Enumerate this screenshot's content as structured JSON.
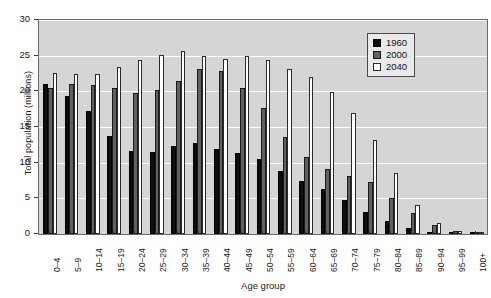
{
  "chart_data": {
    "type": "bar",
    "title": "",
    "xlabel": "Age group",
    "ylabel": "Total population (millions)",
    "ylim": [
      0,
      30
    ],
    "yticks": [
      0,
      5,
      10,
      15,
      20,
      25,
      30
    ],
    "grid": true,
    "legend_position": "top-right",
    "categories": [
      "0–4",
      "5–9",
      "10–14",
      "15–19",
      "20–24",
      "25–29",
      "30–34",
      "35–39",
      "40–44",
      "45–49",
      "50–54",
      "55–59",
      "60–64",
      "65–69",
      "70–74",
      "75–79",
      "80–84",
      "85–89",
      "90–94",
      "95–99",
      "100+"
    ],
    "series": [
      {
        "name": "1960",
        "color": "#0d0d0d",
        "values": [
          21.0,
          19.4,
          17.3,
          13.8,
          11.6,
          11.5,
          12.4,
          12.7,
          11.9,
          11.4,
          10.5,
          8.8,
          7.5,
          6.3,
          4.7,
          3.1,
          1.8,
          0.9,
          0.35,
          0.08,
          0.02
        ]
      },
      {
        "name": "2000",
        "color": "#616161",
        "values": [
          20.4,
          21.1,
          20.9,
          20.5,
          19.8,
          20.2,
          21.4,
          23.2,
          22.9,
          20.5,
          17.6,
          13.6,
          10.8,
          9.1,
          8.2,
          7.3,
          5.0,
          2.9,
          1.3,
          0.37,
          0.07
        ]
      },
      {
        "name": "2040",
        "color": "#ffffff",
        "values": [
          22.6,
          22.4,
          22.5,
          23.4,
          24.4,
          25.1,
          25.7,
          25.0,
          24.6,
          25.0,
          24.4,
          23.1,
          22.0,
          19.9,
          17.0,
          13.2,
          8.5,
          4.1,
          1.6,
          0.45,
          0.12
        ]
      }
    ]
  },
  "legend": {
    "entries": [
      "1960",
      "2000",
      "2040"
    ]
  }
}
